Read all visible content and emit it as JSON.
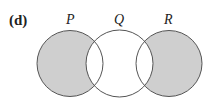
{
  "part_label": "(d)",
  "sets": [
    {
      "name": "P",
      "cx": 70,
      "cy": 63.5,
      "r": 33,
      "shaded": "P - Q"
    },
    {
      "name": "Q",
      "cx": 119.5,
      "cy": 63.5,
      "r": 33.5,
      "shaded": "none"
    },
    {
      "name": "R",
      "cx": 169,
      "cy": 63.5,
      "r": 33,
      "shaded": "R - Q"
    }
  ],
  "colors": {
    "shade": "#cfcfcf",
    "stroke": "#555555"
  }
}
